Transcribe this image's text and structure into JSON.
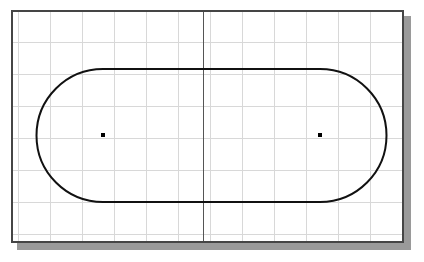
{
  "document": {
    "type": "cad-drawing",
    "title": "Slot Geometry Drawing",
    "top_glyph": "•"
  },
  "canvas": {
    "background_color": "#ffffff",
    "border_color": "#454545",
    "border_width_px": 2,
    "shadow_color": "#9a9a9a",
    "shadow_offset_px": 6,
    "left_px": 11,
    "top_px": 10,
    "width_px": 393,
    "height_px": 233
  },
  "grid": {
    "visible": true,
    "color": "#d8d8d8",
    "spacing_px": 32,
    "origin_x_px": 5,
    "origin_y_px": 30,
    "vertical_lines": [
      5,
      37,
      69,
      101,
      133,
      165,
      197,
      229,
      261,
      293,
      325,
      357,
      389
    ],
    "horizontal_lines": [
      30,
      62,
      94,
      126,
      158,
      190,
      222
    ]
  },
  "axis": {
    "vertical_center_line": {
      "label": "vertical centerline",
      "color": "#555555",
      "x_px": 190,
      "width_px": 1
    }
  },
  "geometry": {
    "shape": "slot",
    "description": "obround / stadium profile with two arc ends and two tangent straight edges",
    "stroke_color": "#111111",
    "stroke_width_px": 2,
    "fill": "none",
    "top_edge_y_px": 57,
    "bottom_edge_y_px": 190,
    "left_arc_center_x_px": 90,
    "right_arc_center_x_px": 307,
    "arc_center_y_px": 123,
    "arc_radius_px": 66.5,
    "overall_width_px": 350,
    "overall_height_px": 133,
    "center_distance_px": 217
  },
  "center_points": [
    {
      "name": "left-center-point",
      "x_px": 90,
      "y_px": 123,
      "size_px": 4,
      "color": "#000000"
    },
    {
      "name": "right-center-point",
      "x_px": 307,
      "y_px": 123,
      "size_px": 4,
      "color": "#000000"
    }
  ]
}
